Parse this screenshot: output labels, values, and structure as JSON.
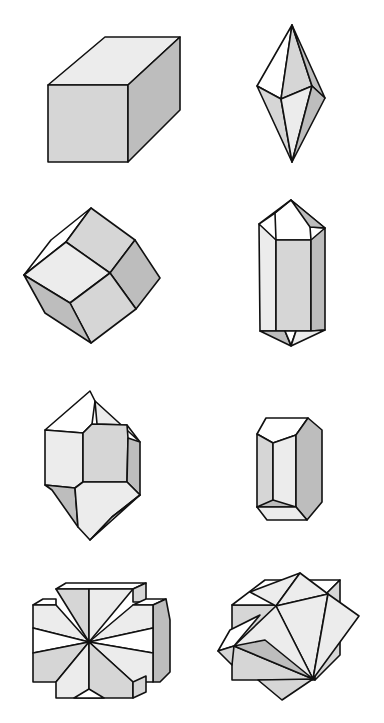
{
  "figure": {
    "width": 384,
    "height": 723,
    "background": "#ffffff",
    "stroke": "#111111",
    "shades": {
      "white": "#ffffff",
      "light": "#ececec",
      "mid": "#d6d6d6",
      "dark": "#bdbdbd"
    },
    "crystals": [
      {
        "name": "cube",
        "faces": [
          {
            "shade": "light",
            "points": "48,85 105,37 180,37 128,85"
          },
          {
            "shade": "mid",
            "points": "48,85 128,85 128,162 48,162"
          },
          {
            "shade": "dark",
            "points": "128,85 180,37 180,110 128,162"
          }
        ]
      },
      {
        "name": "bipyramid",
        "faces": [
          {
            "shade": "white",
            "points": "292,25 257,86 281,99"
          },
          {
            "shade": "mid",
            "points": "292,25 281,99 312,86"
          },
          {
            "shade": "dark",
            "points": "292,25 312,86 325,98"
          },
          {
            "shade": "mid",
            "points": "257,86 281,99 292,162"
          },
          {
            "shade": "light",
            "points": "281,99 312,86 292,162"
          },
          {
            "shade": "dark",
            "points": "312,86 325,98 292,162"
          }
        ]
      },
      {
        "name": "rhombic-dodecahedron",
        "faces": [
          {
            "shade": "white",
            "points": "91,208 51,240 24,275 66,242"
          },
          {
            "shade": "mid",
            "points": "91,208 66,242 110,273 135,240"
          },
          {
            "shade": "light",
            "points": "24,275 66,242 110,273 70,303"
          },
          {
            "shade": "dark",
            "points": "135,240 160,278 136,309 110,273"
          },
          {
            "shade": "mid",
            "points": "110,273 136,309 91,343 70,303"
          },
          {
            "shade": "dark",
            "points": "24,275 70,303 91,343 45,313"
          }
        ]
      },
      {
        "name": "hexagonal-prism-doubly-terminated",
        "faces": [
          {
            "shade": "white",
            "points": "291,200 275,213 276,240 311,240 310,227 325,228"
          },
          {
            "shade": "mid",
            "points": "291,200 259,224 275,213"
          },
          {
            "shade": "dark",
            "points": "291,200 310,227 325,228"
          },
          {
            "shade": "light",
            "points": "259,224 276,240 276,331 260,331"
          },
          {
            "shade": "mid",
            "points": "276,240 311,240 311,331 276,331"
          },
          {
            "shade": "dark",
            "points": "311,240 325,228 325,330 311,331"
          },
          {
            "shade": "dark",
            "points": "260,331 276,331 285,331 291,346"
          },
          {
            "shade": "white",
            "points": "285,331 296,331 291,345"
          },
          {
            "shade": "light",
            "points": "296,331 311,331 325,330 291,346"
          }
        ]
      },
      {
        "name": "quartz-crystal",
        "faces": [
          {
            "shade": "white",
            "points": "90,391 45,430 83,433 92,424 95,401"
          },
          {
            "shade": "light",
            "points": "95,401 97,424 127,425 140,442"
          },
          {
            "shade": "light",
            "points": "45,430 83,433 83,482 75,488 45,485"
          },
          {
            "shade": "mid",
            "points": "83,433 92,424 127,425 128,438 127,482 83,482"
          },
          {
            "shade": "dark",
            "points": "128,438 140,442 140,495 127,482"
          },
          {
            "shade": "dark",
            "points": "45,485 75,488 78,527 52,490"
          },
          {
            "shade": "light",
            "points": "75,488 83,482 127,482 140,495 112,517 90,540 78,527"
          },
          {
            "shade": "light",
            "points": "140,495 112,517 90,540"
          }
        ]
      },
      {
        "name": "short-prism",
        "faces": [
          {
            "shade": "white",
            "points": "266,418 308,418 296,435 273,443 257,434"
          },
          {
            "shade": "mid",
            "points": "257,434 273,443 273,505 257,507"
          },
          {
            "shade": "light",
            "points": "273,443 296,435 296,507 273,505"
          },
          {
            "shade": "dark",
            "points": "296,435 308,418 322,430 322,502 307,520 296,507"
          },
          {
            "shade": "dark",
            "points": "257,507 273,500 296,507"
          },
          {
            "shade": "light",
            "points": "257,507 296,507 307,520 267,520"
          }
        ]
      },
      {
        "name": "cross-twin",
        "faces": [
          {
            "shade": "white",
            "points": "56,589 66,583 146,583 133,589"
          },
          {
            "shade": "mid",
            "points": "133,589 146,583 146,602 133,602"
          },
          {
            "shade": "white",
            "points": "33,605 43,599 56,599 56,605"
          },
          {
            "shade": "white",
            "points": "133,605 146,599 166,599 153,605"
          },
          {
            "shade": "dark",
            "points": "153,605 166,599 170,620 170,672 160,682 153,682"
          },
          {
            "shade": "mid",
            "points": "56,589 89,589 89,642"
          },
          {
            "shade": "light",
            "points": "89,589 133,589 89,642"
          },
          {
            "shade": "light",
            "points": "33,605 56,605 89,642 33,628"
          },
          {
            "shade": "light",
            "points": "133,605 153,605 153,628 89,642"
          },
          {
            "shade": "white",
            "points": "33,628 89,642 33,653"
          },
          {
            "shade": "white",
            "points": "153,628 153,653 89,642"
          },
          {
            "shade": "mid",
            "points": "33,653 89,642 56,682 33,682"
          },
          {
            "shade": "light",
            "points": "89,642 153,653 153,682 133,682"
          },
          {
            "shade": "light",
            "points": "56,682 89,642 89,698 56,698"
          },
          {
            "shade": "mid",
            "points": "89,642 133,682 133,698 89,698"
          },
          {
            "shade": "white",
            "points": "74,698 89,689 104,698"
          },
          {
            "shade": "mid",
            "points": "133,682 146,676 146,692 133,698"
          }
        ]
      },
      {
        "name": "penetration-twin",
        "faces": [
          {
            "shade": "mid",
            "points": "232,605 315,605 315,680 232,680"
          },
          {
            "shade": "white",
            "points": "232,605 265,580 340,580 315,605"
          },
          {
            "shade": "mid",
            "points": "315,605 340,580 340,655 315,680"
          },
          {
            "shade": "light",
            "points": "300,573 276,606 250,592"
          },
          {
            "shade": "light",
            "points": "300,573 328,594 276,606"
          },
          {
            "shade": "light",
            "points": "276,606 328,594 313,679"
          },
          {
            "shade": "light",
            "points": "328,594 359,616 313,679"
          },
          {
            "shade": "light",
            "points": "276,606 234,646 313,679"
          },
          {
            "shade": "dark",
            "points": "234,646 265,640 313,679"
          },
          {
            "shade": "white",
            "points": "234,646 218,651 230,630 260,615"
          },
          {
            "shade": "mid",
            "points": "218,651 234,646 232,665"
          },
          {
            "shade": "mid",
            "points": "258,680 313,679 282,700"
          }
        ]
      }
    ]
  }
}
